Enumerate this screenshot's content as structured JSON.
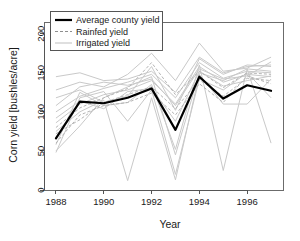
{
  "chart_data": {
    "type": "line",
    "title": "",
    "xlabel": "Year",
    "ylabel": "Corn yield [bushles/acre]",
    "xlim": [
      1987.5,
      1997.5
    ],
    "ylim": [
      0,
      215
    ],
    "xticks": [
      1988,
      1990,
      1992,
      1994,
      1996
    ],
    "xtick_labels": [
      "1988",
      "1990",
      "1992",
      "1994",
      "1996"
    ],
    "yticks": [
      0,
      50,
      100,
      150,
      200
    ],
    "ytick_labels": [
      "0",
      "50",
      "100",
      "150",
      "200"
    ],
    "grid": false,
    "legend_position": "top-left",
    "x": [
      1988,
      1989,
      1990,
      1991,
      1992,
      1993,
      1994,
      1995,
      1996,
      1997
    ],
    "series": [
      {
        "name": "Average county yield",
        "style": "solid-bold-black",
        "color": "#000000",
        "values": [
          66,
          113,
          111,
          118,
          130,
          77,
          145,
          117,
          134,
          127
        ]
      },
      {
        "name": "Rainfed yield",
        "style": "dashed-gray",
        "color": "#b4b4b4",
        "values": [
          72,
          90,
          112,
          122,
          132,
          104,
          141,
          120,
          143,
          140
        ]
      },
      {
        "name": "Rainfed yield",
        "style": "dashed-gray",
        "color": "#b4b4b4",
        "values": [
          80,
          105,
          118,
          130,
          163,
          122,
          152,
          131,
          150,
          148
        ]
      },
      {
        "name": "Rainfed yield",
        "style": "dashed-gray",
        "color": "#b4b4b4",
        "values": [
          60,
          96,
          108,
          112,
          124,
          96,
          136,
          112,
          146,
          136
        ]
      },
      {
        "name": "Irrigated yield",
        "style": "solid-light-gray",
        "color": "#c9c9c9",
        "values": [
          145,
          150,
          140,
          142,
          152,
          125,
          170,
          150,
          158,
          160
        ]
      },
      {
        "name": "Irrigated yield",
        "style": "solid-light-gray",
        "color": "#c9c9c9",
        "values": [
          128,
          138,
          132,
          148,
          175,
          140,
          188,
          152,
          156,
          170
        ]
      },
      {
        "name": "Irrigated yield",
        "style": "solid-light-gray",
        "color": "#c9c9c9",
        "values": [
          100,
          120,
          130,
          138,
          148,
          118,
          163,
          143,
          152,
          150
        ]
      },
      {
        "name": "Irrigated yield",
        "style": "solid-light-gray",
        "color": "#c9c9c9",
        "values": [
          86,
          110,
          122,
          128,
          140,
          110,
          158,
          138,
          148,
          145
        ]
      },
      {
        "name": "Irrigated yield",
        "style": "solid-light-gray",
        "color": "#c9c9c9",
        "values": [
          50,
          82,
          118,
          132,
          145,
          45,
          150,
          140,
          155,
          152
        ]
      },
      {
        "name": "Irrigated yield",
        "style": "solid-light-gray",
        "color": "#c9c9c9",
        "values": [
          48,
          118,
          126,
          88,
          128,
          20,
          142,
          128,
          150,
          118
        ]
      },
      {
        "name": "Irrigated yield",
        "style": "solid-light-gray",
        "color": "#c9c9c9",
        "values": [
          58,
          125,
          108,
          112,
          135,
          52,
          160,
          25,
          155,
          60
        ]
      },
      {
        "name": "Irrigated yield",
        "style": "solid-light-gray",
        "color": "#c9c9c9",
        "values": [
          75,
          100,
          115,
          12,
          118,
          13,
          148,
          110,
          110,
          142
        ]
      },
      {
        "name": "Irrigated yield",
        "style": "solid-light-gray",
        "color": "#c9c9c9",
        "values": [
          118,
          128,
          112,
          120,
          158,
          102,
          168,
          148,
          160,
          158
        ]
      },
      {
        "name": "Irrigated yield",
        "style": "solid-light-gray",
        "color": "#c9c9c9",
        "values": [
          108,
          132,
          138,
          134,
          142,
          108,
          155,
          142,
          146,
          164
        ]
      },
      {
        "name": "Irrigated yield",
        "style": "solid-light-gray",
        "color": "#c9c9c9",
        "values": [
          92,
          114,
          104,
          126,
          130,
          88,
          152,
          133,
          140,
          146
        ]
      }
    ]
  },
  "legend": {
    "entries": [
      {
        "label": "Average county yield",
        "style": "solid-bold-black"
      },
      {
        "label": "Rainfed yield",
        "style": "dashed-gray"
      },
      {
        "label": "Irrigated yield",
        "style": "solid-light-gray"
      }
    ]
  },
  "colors": {
    "average": "#000000",
    "rainfed": "#b4b4b4",
    "irrigated": "#c9c9c9",
    "axis": "#555555",
    "text": "#1a1a1a",
    "background": "#ffffff"
  }
}
